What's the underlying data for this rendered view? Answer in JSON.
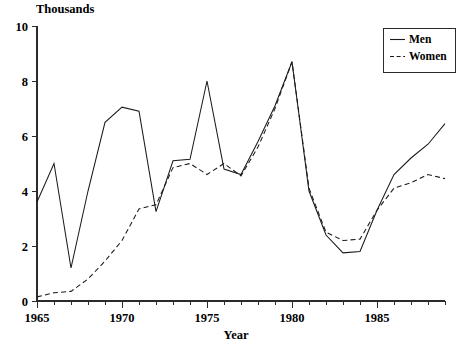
{
  "chart_data": {
    "type": "line",
    "title": "",
    "ylabel": "Thousands",
    "xlabel": "Year",
    "xlim": [
      1965,
      1989
    ],
    "ylim": [
      0,
      10
    ],
    "ytick_labels": [
      "0",
      "2",
      "4",
      "6",
      "8",
      "10"
    ],
    "ytick_values": [
      0,
      2,
      4,
      6,
      8,
      10
    ],
    "xtick_labels": [
      "1965",
      "1970",
      "1975",
      "1980",
      "1985"
    ],
    "xtick_values": [
      1965,
      1970,
      1975,
      1980,
      1985
    ],
    "xtick_minor_values": [
      1966,
      1967,
      1968,
      1969,
      1971,
      1972,
      1973,
      1974,
      1976,
      1977,
      1978,
      1979,
      1981,
      1982,
      1983,
      1984,
      1986,
      1987,
      1988,
      1989
    ],
    "grid": false,
    "legend_position": "top-right",
    "x": [
      1965,
      1966,
      1967,
      1968,
      1969,
      1970,
      1971,
      1972,
      1973,
      1974,
      1975,
      1976,
      1977,
      1978,
      1979,
      1980,
      1981,
      1982,
      1983,
      1984,
      1985,
      1986,
      1987,
      1988,
      1989
    ],
    "series": [
      {
        "name": "Men",
        "style": "solid",
        "color": "#1a1a1a",
        "values": [
          3.6,
          5.0,
          1.2,
          4.0,
          6.5,
          7.05,
          6.9,
          3.25,
          5.1,
          5.15,
          8.0,
          4.8,
          4.6,
          5.8,
          7.1,
          8.7,
          4.0,
          2.4,
          1.75,
          1.8,
          3.3,
          4.6,
          5.2,
          5.7,
          6.45
        ]
      },
      {
        "name": "Women",
        "style": "dashed",
        "color": "#1a1a1a",
        "values": [
          0.15,
          0.3,
          0.35,
          0.8,
          1.45,
          2.2,
          3.35,
          3.5,
          4.85,
          5.0,
          4.6,
          5.0,
          4.55,
          5.6,
          7.0,
          8.7,
          4.1,
          2.5,
          2.2,
          2.25,
          3.3,
          4.1,
          4.3,
          4.6,
          4.45
        ]
      }
    ]
  },
  "legend": {
    "entries": [
      {
        "label": "Men"
      },
      {
        "label": "Women"
      }
    ]
  },
  "axes": {
    "y_title": "Thousands",
    "x_title": "Year"
  }
}
